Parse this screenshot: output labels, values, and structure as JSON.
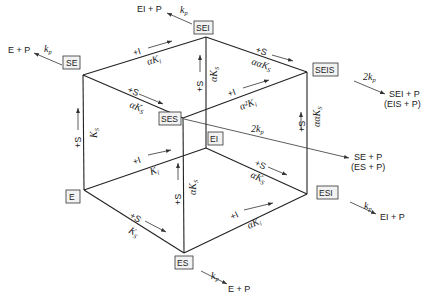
{
  "diagram": {
    "type": "enzyme-kinetics-cube",
    "nodes": {
      "E": "E",
      "ES": "ES",
      "SE": "SE",
      "SES": "SES",
      "EI": "EI",
      "ESI": "ESI",
      "SEI": "SEI",
      "SEIS": "SEIS"
    },
    "products": {
      "se_product": "E + P",
      "sei_product": "EI + P",
      "seis_product_line1": "SEI + P",
      "seis_product_line2": "(EIS + P)",
      "ses_product_line1": "SE + P",
      "ses_product_line2": "(ES + P)",
      "esi_product": "EI + P",
      "es_product": "E + P"
    },
    "rates": {
      "kp": "k",
      "kp_sub": "p",
      "two_kp": "2k"
    },
    "edge_labels": {
      "plus_S": "+S",
      "plus_I": "+I",
      "K": "K",
      "sub_s": "S",
      "sub_i": "i",
      "alpha": "α",
      "alpha_alpha": "αα",
      "alpha_sq": "α²"
    }
  }
}
